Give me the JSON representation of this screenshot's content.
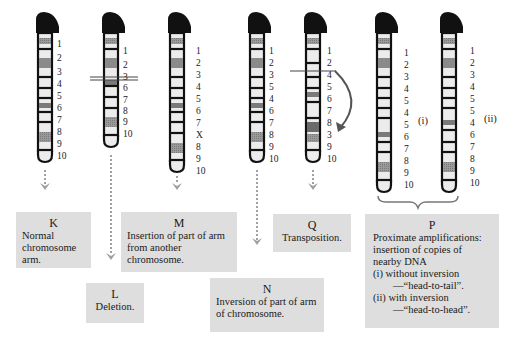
{
  "figure": {
    "type": "chromosome-rearrangement-diagram",
    "colors": {
      "outline": "#111111",
      "centromere": "#111111",
      "band_dark": "#8a8a8a",
      "band_light": "#ececec",
      "arrow": "#a0a0a0",
      "box_bg": "#dedede",
      "curve_arrow": "#555555"
    }
  },
  "chromosomes": [
    {
      "id": "K",
      "x": 38,
      "top": 13,
      "bottom": 160,
      "labels": [
        "1",
        "2",
        "3",
        "4",
        "5",
        "6",
        "7",
        "8",
        "9",
        "10"
      ]
    },
    {
      "id": "L",
      "x": 104,
      "top": 13,
      "bottom": 145,
      "labels": [
        "1",
        "2",
        "3",
        "6",
        "7",
        "8",
        "9",
        "10"
      ],
      "deletion_mark_after": "3"
    },
    {
      "id": "M",
      "x": 170,
      "top": 13,
      "bottom": 170,
      "labels": [
        "1",
        "2",
        "3",
        "4",
        "5",
        "6",
        "7",
        "X",
        "8",
        "9",
        "10"
      ]
    },
    {
      "id": "N",
      "x": 250,
      "top": 13,
      "bottom": 160,
      "labels": [
        "1",
        "2",
        "3",
        "5",
        "4",
        "6",
        "7",
        "8",
        "9",
        "10"
      ]
    },
    {
      "id": "Q",
      "x": 306,
      "top": 13,
      "bottom": 160,
      "labels": [
        "1",
        "2",
        "4",
        "5",
        "6",
        "7",
        "8",
        "3",
        "9",
        "10"
      ],
      "transposition_mark_after": "2"
    },
    {
      "id": "P-i",
      "x": 377,
      "top": 13,
      "bottom": 190,
      "labels": [
        "1",
        "2",
        "3",
        "4",
        "5",
        "4",
        "5",
        "6",
        "7",
        "8",
        "9",
        "10"
      ],
      "side_label": "(i)"
    },
    {
      "id": "P-ii",
      "x": 442,
      "top": 13,
      "bottom": 190,
      "labels": [
        "1",
        "2",
        "3",
        "4",
        "5",
        "5",
        "4",
        "6",
        "7",
        "8",
        "9",
        "10"
      ],
      "side_label": "(ii)"
    }
  ],
  "boxes": {
    "K": {
      "title": "K",
      "text": "Normal chromosome arm."
    },
    "L": {
      "title": "L",
      "text": "Deletion."
    },
    "M": {
      "title": "M",
      "text": "Insertion of part of arm from another chromosome."
    },
    "N": {
      "title": "N",
      "text": "Inversion of part of arm of chromosome."
    },
    "Q": {
      "title": "Q",
      "text": "Transposition."
    },
    "P": {
      "title": "P",
      "lines": [
        "Proximate amplifications:",
        "insertion of copies of",
        "nearby DNA",
        "(i) without inversion",
        "—“head-to-tail”.",
        "(ii) with inversion",
        "—“head-to-head”."
      ]
    }
  },
  "side_labels": {
    "p_i": "(i)",
    "p_ii": "(ii)"
  },
  "labels": {
    "K": [
      "1",
      "2",
      "3",
      "4",
      "5",
      "6",
      "7",
      "8",
      "9",
      "10"
    ],
    "L": [
      "1",
      "2",
      "3",
      "6",
      "7",
      "8",
      "9",
      "10"
    ],
    "M": [
      "1",
      "2",
      "3",
      "4",
      "5",
      "6",
      "7",
      "X",
      "8",
      "9",
      "10"
    ],
    "N": [
      "1",
      "2",
      "3",
      "5",
      "4",
      "6",
      "7",
      "8",
      "9",
      "10"
    ],
    "Q": [
      "1",
      "2",
      "4",
      "5",
      "6",
      "7",
      "8",
      "3",
      "9",
      "10"
    ],
    "Pi": [
      "1",
      "2",
      "3",
      "4",
      "5",
      "4",
      "5",
      "6",
      "7",
      "8",
      "9",
      "10"
    ],
    "Pii": [
      "1",
      "2",
      "3",
      "4",
      "5",
      "5",
      "4",
      "6",
      "7",
      "8",
      "9",
      "10"
    ]
  }
}
